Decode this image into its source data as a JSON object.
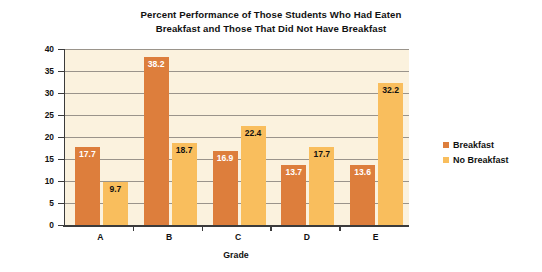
{
  "chart_data": {
    "type": "bar",
    "title": "Percent Performance of Those Students Who Had Eaten Breakfast and Those That Did Not Have Breakfast",
    "title_lines": [
      "Percent Performance of Those Students Who Had Eaten",
      "Breakfast and Those That Did Not Have Breakfast"
    ],
    "xlabel": "Grade",
    "ylabel": "Percent",
    "categories": [
      "A",
      "B",
      "C",
      "D",
      "E"
    ],
    "series": [
      {
        "name": "Breakfast",
        "color": "#DD7E3C",
        "values": [
          17.7,
          38.2,
          16.9,
          13.7,
          13.6
        ]
      },
      {
        "name": "No Breakfast",
        "color": "#F9BE5D",
        "values": [
          9.7,
          18.7,
          22.4,
          17.7,
          32.2
        ]
      }
    ],
    "ylim": [
      0,
      40
    ],
    "yticks": [
      40,
      35,
      30,
      25,
      20,
      15,
      10,
      5,
      0
    ],
    "ytick_labels": [
      "40",
      "35",
      "30",
      "25",
      "20",
      "15",
      "10",
      "5",
      "0"
    ],
    "grid": true,
    "grid_color": "#9A948B",
    "plot_background": "#FBF2DE",
    "legend_position": "right",
    "value_labels": [
      "17.7",
      "9.7",
      "38.2",
      "18.7",
      "16.9",
      "22.4",
      "13.7",
      "17.7",
      "13.6",
      "32.2"
    ]
  },
  "legend": {
    "items": [
      {
        "label": "Breakfast",
        "color": "#DD7E3C"
      },
      {
        "label": "No Breakfast",
        "color": "#F9BE5D"
      }
    ]
  }
}
